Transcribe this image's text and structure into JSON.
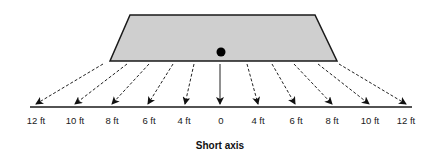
{
  "diagram": {
    "title": "Short axis",
    "object": {
      "shape": "trapezoid",
      "fill": "#cfcfcf",
      "stroke": "#1a1a1a",
      "top_left": [
        130,
        15
      ],
      "top_right": [
        315,
        15
      ],
      "bottom_right": [
        337,
        61
      ],
      "bottom_left": [
        110,
        61
      ],
      "center_dot": [
        221,
        52
      ]
    },
    "axis": {
      "y": 107,
      "x_start": 30,
      "x_end": 412,
      "color": "#1a1a1a"
    },
    "arrows": [
      {
        "label": "12 ft",
        "from": [
          103,
          64
        ],
        "to": [
          36,
          104
        ],
        "style": "dashed"
      },
      {
        "label": "10 ft",
        "from": [
          127,
          64
        ],
        "to": [
          75,
          104
        ],
        "style": "dashed"
      },
      {
        "label": "8 ft",
        "from": [
          149,
          64
        ],
        "to": [
          112,
          104
        ],
        "style": "dashed"
      },
      {
        "label": "6 ft",
        "from": [
          173,
          64
        ],
        "to": [
          148,
          104
        ],
        "style": "dashed"
      },
      {
        "label": "4 ft",
        "from": [
          194,
          64
        ],
        "to": [
          185,
          104
        ],
        "style": "dashed"
      },
      {
        "label": "0",
        "from": [
          220,
          64
        ],
        "to": [
          220,
          104
        ],
        "style": "solid"
      },
      {
        "label": "4 ft",
        "from": [
          247,
          64
        ],
        "to": [
          258,
          104
        ],
        "style": "dashed"
      },
      {
        "label": "6 ft",
        "from": [
          272,
          64
        ],
        "to": [
          295,
          104
        ],
        "style": "dashed"
      },
      {
        "label": "8 ft",
        "from": [
          294,
          64
        ],
        "to": [
          332,
          104
        ],
        "style": "dashed"
      },
      {
        "label": "10 ft",
        "from": [
          318,
          64
        ],
        "to": [
          369,
          104
        ],
        "style": "dashed"
      },
      {
        "label": "12 ft",
        "from": [
          339,
          64
        ],
        "to": [
          406,
          104
        ],
        "style": "dashed"
      }
    ],
    "tick_labels": [
      {
        "text": "12 ft",
        "x": 36
      },
      {
        "text": "10 ft",
        "x": 75
      },
      {
        "text": "8 ft",
        "x": 112
      },
      {
        "text": "6 ft",
        "x": 149
      },
      {
        "text": "4 ft",
        "x": 184
      },
      {
        "text": "0",
        "x": 221
      },
      {
        "text": "4 ft",
        "x": 258
      },
      {
        "text": "6 ft",
        "x": 296
      },
      {
        "text": "8 ft",
        "x": 332
      },
      {
        "text": "10 ft",
        "x": 370
      },
      {
        "text": "12 ft",
        "x": 406
      }
    ]
  }
}
